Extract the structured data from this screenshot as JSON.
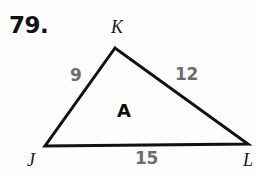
{
  "figure": {
    "problem_number": "79.",
    "region_label": "A",
    "stroke_color": "#111111",
    "label_color": "#161616",
    "measure_color": "#6d6d6d",
    "background_color": "#fdfdfd",
    "stroke_width": 3,
    "vertices": [
      {
        "name": "K",
        "label": "K",
        "x": 115,
        "y": 48
      },
      {
        "name": "J",
        "label": "J",
        "x": 45,
        "y": 146
      },
      {
        "name": "L",
        "label": "L",
        "x": 248,
        "y": 144
      }
    ],
    "sides": [
      {
        "name": "JK",
        "label": "9",
        "from": "J",
        "to": "K"
      },
      {
        "name": "KL",
        "label": "12",
        "from": "K",
        "to": "L"
      },
      {
        "name": "JL",
        "label": "15",
        "from": "J",
        "to": "L"
      }
    ]
  }
}
